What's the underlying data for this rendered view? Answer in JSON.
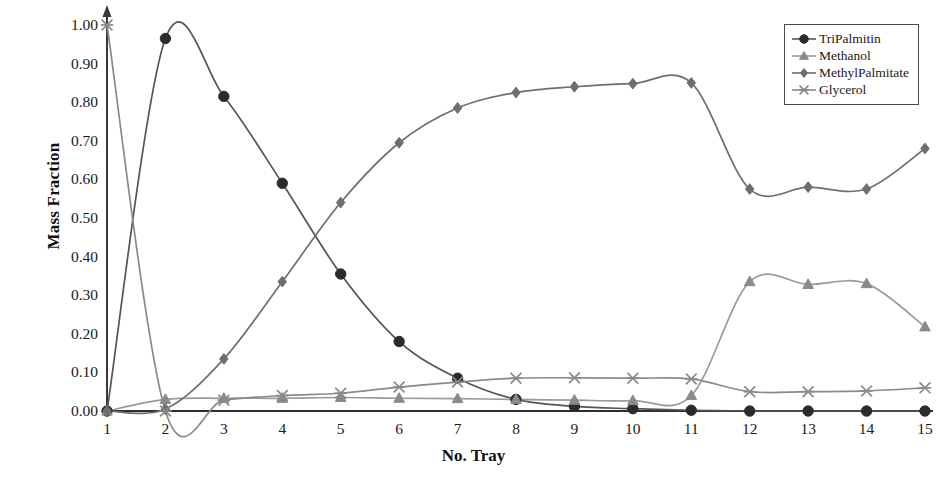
{
  "chart_data": {
    "type": "line",
    "title": "",
    "xlabel": "No. Tray",
    "ylabel": "Mass Fraction",
    "x": [
      1,
      2,
      3,
      4,
      5,
      6,
      7,
      8,
      9,
      10,
      11,
      12,
      13,
      14,
      15
    ],
    "xtick_labels": [
      "1",
      "2",
      "3",
      "4",
      "5",
      "6",
      "7",
      "8",
      "9",
      "10",
      "11",
      "12",
      "13",
      "14",
      "15"
    ],
    "ytick_labels": [
      "0.00",
      "0.10",
      "0.20",
      "0.30",
      "0.40",
      "0.50",
      "0.60",
      "0.70",
      "0.80",
      "0.90",
      "1.00"
    ],
    "ytick_values": [
      0.0,
      0.1,
      0.2,
      0.3,
      0.4,
      0.5,
      0.6,
      0.7,
      0.8,
      0.9,
      1.0
    ],
    "xlim": [
      1,
      15
    ],
    "ylim": [
      0.0,
      1.0
    ],
    "grid": false,
    "legend_position": "top-right",
    "series": [
      {
        "name": "TriPalmitin",
        "marker": "circle",
        "color": "#2b2b2b",
        "line_color": "#555555",
        "values": [
          0.0,
          0.965,
          0.815,
          0.59,
          0.355,
          0.18,
          0.085,
          0.03,
          0.012,
          0.006,
          0.002,
          0.0,
          0.0,
          0.0,
          0.0
        ]
      },
      {
        "name": "Methanol",
        "marker": "triangle",
        "color": "#8a8a8a",
        "line_color": "#9a9a9a",
        "values": [
          0.0,
          0.03,
          0.033,
          0.033,
          0.035,
          0.033,
          0.032,
          0.03,
          0.028,
          0.027,
          0.04,
          0.335,
          0.328,
          0.33,
          0.218
        ]
      },
      {
        "name": "MethylPalmitate",
        "marker": "diamond",
        "color": "#6e6e6e",
        "line_color": "#6e6e6e",
        "values": [
          0.0,
          0.005,
          0.135,
          0.335,
          0.54,
          0.695,
          0.785,
          0.825,
          0.84,
          0.848,
          0.85,
          0.575,
          0.58,
          0.575,
          0.68
        ]
      },
      {
        "name": "Glycerol",
        "marker": "cross",
        "color": "#8a8a8a",
        "line_color": "#8a8a8a",
        "values": [
          1.0,
          0.0,
          0.028,
          0.04,
          0.046,
          0.062,
          0.075,
          0.085,
          0.086,
          0.085,
          0.083,
          0.05,
          0.05,
          0.052,
          0.06
        ]
      }
    ]
  },
  "legend": {
    "items": [
      {
        "label": "TriPalmitin",
        "marker": "circle"
      },
      {
        "label": "Methanol",
        "marker": "triangle"
      },
      {
        "label": "MethylPalmitate",
        "marker": "diamond"
      },
      {
        "label": "Glycerol",
        "marker": "cross"
      }
    ]
  }
}
